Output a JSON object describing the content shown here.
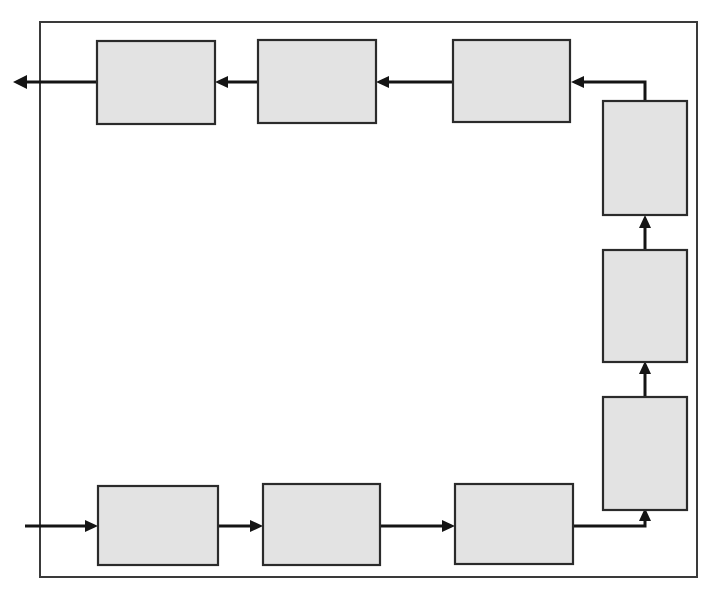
{
  "diagram": {
    "type": "closed-loop-process-flow",
    "canvas": {
      "width": 715,
      "height": 598,
      "background": "#ffffff"
    },
    "colors": {
      "box_fill": "#e3e3e3",
      "box_stroke": "#2b2b2b",
      "line": "#141414",
      "border": "#3a3a3a"
    },
    "loop_border": {
      "x": 40,
      "y": 22,
      "width": 657,
      "height": 555
    },
    "boxes": [
      {
        "id": "top-1",
        "label": "",
        "x": 97,
        "y": 41,
        "width": 118,
        "height": 83,
        "orientation": "horizontal"
      },
      {
        "id": "top-2",
        "label": "",
        "x": 258,
        "y": 40,
        "width": 118,
        "height": 83,
        "orientation": "horizontal"
      },
      {
        "id": "top-3",
        "label": "",
        "x": 453,
        "y": 40,
        "width": 117,
        "height": 82,
        "orientation": "horizontal"
      },
      {
        "id": "right-upper",
        "label": "",
        "x": 603,
        "y": 101,
        "width": 84,
        "height": 114,
        "orientation": "vertical"
      },
      {
        "id": "right-middle",
        "label": "",
        "x": 603,
        "y": 250,
        "width": 84,
        "height": 112,
        "orientation": "vertical"
      },
      {
        "id": "right-lower",
        "label": "",
        "x": 603,
        "y": 397,
        "width": 84,
        "height": 113,
        "orientation": "vertical"
      },
      {
        "id": "bottom-1",
        "label": "",
        "x": 98,
        "y": 486,
        "width": 120,
        "height": 79,
        "orientation": "horizontal"
      },
      {
        "id": "bottom-2",
        "label": "",
        "x": 263,
        "y": 484,
        "width": 117,
        "height": 81,
        "orientation": "horizontal"
      },
      {
        "id": "bottom-3",
        "label": "",
        "x": 455,
        "y": 484,
        "width": 118,
        "height": 80,
        "orientation": "horizontal"
      }
    ],
    "connectors": [
      {
        "id": "input-arrow",
        "from": "external-left",
        "to": "bottom-1",
        "direction": "right",
        "label": ""
      },
      {
        "id": "bottom1-to-bottom2",
        "from": "bottom-1",
        "to": "bottom-2",
        "direction": "right",
        "label": ""
      },
      {
        "id": "bottom2-to-bottom3",
        "from": "bottom-2",
        "to": "bottom-3",
        "direction": "right",
        "label": ""
      },
      {
        "id": "bottom3-to-rightlower",
        "from": "bottom-3",
        "to": "right-lower",
        "direction": "up",
        "label": ""
      },
      {
        "id": "rightlower-to-rightmiddle",
        "from": "right-lower",
        "to": "right-middle",
        "direction": "up",
        "label": ""
      },
      {
        "id": "rightmiddle-to-rightupper",
        "from": "right-middle",
        "to": "right-upper",
        "direction": "up",
        "label": ""
      },
      {
        "id": "rightupper-to-top3",
        "from": "right-upper",
        "to": "top-3",
        "direction": "left",
        "label": ""
      },
      {
        "id": "top3-to-top2",
        "from": "top-3",
        "to": "top-2",
        "direction": "left",
        "label": ""
      },
      {
        "id": "top2-to-top1",
        "from": "top-2",
        "to": "top-1",
        "direction": "left",
        "label": ""
      },
      {
        "id": "output-arrow",
        "from": "top-1",
        "to": "external-left",
        "direction": "left",
        "label": ""
      }
    ]
  }
}
